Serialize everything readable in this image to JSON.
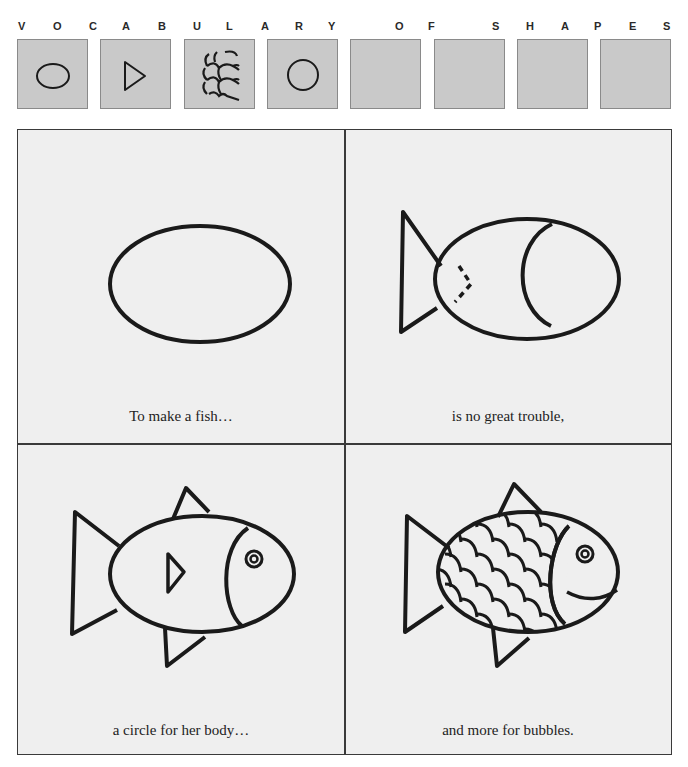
{
  "header": {
    "letters": [
      {
        "char": "V",
        "x": 18
      },
      {
        "char": "O",
        "x": 53
      },
      {
        "char": "C",
        "x": 89
      },
      {
        "char": "A",
        "x": 122
      },
      {
        "char": "B",
        "x": 158
      },
      {
        "char": "U",
        "x": 193
      },
      {
        "char": "L",
        "x": 226
      },
      {
        "char": "A",
        "x": 261
      },
      {
        "char": "R",
        "x": 295
      },
      {
        "char": "Y",
        "x": 328
      },
      {
        "char": "O",
        "x": 395
      },
      {
        "char": "F",
        "x": 428
      },
      {
        "char": "S",
        "x": 492
      },
      {
        "char": "H",
        "x": 526
      },
      {
        "char": "A",
        "x": 561
      },
      {
        "char": "P",
        "x": 594
      },
      {
        "char": "E",
        "x": 629
      },
      {
        "char": "S",
        "x": 663
      }
    ]
  },
  "vocabulary_boxes": [
    {
      "shape": "oval",
      "x": 17
    },
    {
      "shape": "triangle",
      "x": 100
    },
    {
      "shape": "scales",
      "x": 184
    },
    {
      "shape": "circle",
      "x": 267
    },
    {
      "shape": "empty",
      "x": 350
    },
    {
      "shape": "empty",
      "x": 434
    },
    {
      "shape": "empty",
      "x": 517
    },
    {
      "shape": "empty",
      "x": 600
    }
  ],
  "panels": [
    {
      "step": 1,
      "caption": "To make a fish…",
      "drawing": "oval body"
    },
    {
      "step": 2,
      "caption": "is no great trouble,",
      "drawing": "oval body with tail triangle and head circle"
    },
    {
      "step": 3,
      "caption": "a circle for her body…",
      "drawing": "fish with fins, gill triangle and eye"
    },
    {
      "step": 4,
      "caption": "and more for bubbles.",
      "drawing": "fish with scales, eye and smile"
    }
  ],
  "colors": {
    "ink": "#1a1a1a",
    "box_fill": "#c9c9c9",
    "panel_fill": "#efefef"
  }
}
